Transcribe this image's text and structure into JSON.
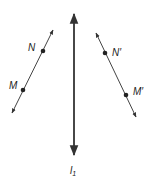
{
  "diagram": {
    "type": "reflection",
    "axis": {
      "label": "l",
      "subscript": "1",
      "x": 74,
      "y_top": 12,
      "y_bottom": 157
    },
    "left_line": {
      "from": [
        53,
        30
      ],
      "to": [
        12,
        113
      ],
      "points": [
        {
          "label": "N",
          "x": 43,
          "y": 51
        },
        {
          "label": "M",
          "x": 23,
          "y": 90
        }
      ]
    },
    "right_line": {
      "from": [
        96,
        33
      ],
      "to": [
        136,
        117
      ],
      "points": [
        {
          "label": "N′",
          "x": 105,
          "y": 53
        },
        {
          "label": "M′",
          "x": 126,
          "y": 95
        }
      ]
    },
    "color": "#333333"
  }
}
